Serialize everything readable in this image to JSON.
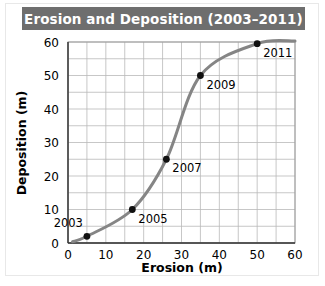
{
  "figure": {
    "title": "Erosion and Deposition (2003–2011)",
    "title_bar_color": "#6e6e6e",
    "title_text_color": "#ffffff",
    "background_color": "#ffffff"
  },
  "chart_data": {
    "type": "line",
    "title": "Erosion and Deposition (2003–2011)",
    "xlabel": "Erosion (m)",
    "ylabel": "Deposition (m)",
    "xlim": [
      0,
      60
    ],
    "ylim": [
      0,
      60
    ],
    "xticks": [
      "0",
      "10",
      "20",
      "30",
      "40",
      "50",
      "60"
    ],
    "yticks": [
      "0",
      "10",
      "20",
      "30",
      "40",
      "50",
      "60"
    ],
    "xtick_values": [
      0,
      10,
      20,
      30,
      40,
      50,
      60
    ],
    "ytick_values": [
      0,
      10,
      20,
      30,
      40,
      50,
      60
    ],
    "grid": true,
    "grid_step": 5,
    "legend": null,
    "line_color": "#858585",
    "marker_color": "#111111",
    "series": [
      {
        "name": "Erosion vs Deposition",
        "x": [
          5,
          17,
          26,
          35,
          50
        ],
        "y": [
          2,
          10,
          25,
          50,
          59.5
        ],
        "point_labels": [
          "2003",
          "2005",
          "2007",
          "2009",
          "2011"
        ]
      }
    ],
    "annotations": [
      {
        "text": "2003",
        "x": 5,
        "y": 2,
        "position": "above-left"
      },
      {
        "text": "2005",
        "x": 17,
        "y": 10,
        "position": "below-right"
      },
      {
        "text": "2007",
        "x": 26,
        "y": 25,
        "position": "below-right"
      },
      {
        "text": "2009",
        "x": 35,
        "y": 50,
        "position": "below-right"
      },
      {
        "text": "2011",
        "x": 50,
        "y": 59.5,
        "position": "below-right"
      }
    ]
  }
}
